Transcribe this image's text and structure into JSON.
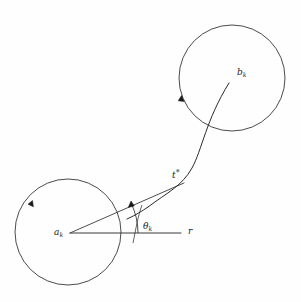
{
  "figure": {
    "domain_note": "geometric diagram with two circles, a curved trajectory, an angle and a reference ray",
    "background_color": "#fefefe",
    "stroke_color": "#262626",
    "labels": {
      "source_center": {
        "base": "a",
        "subscript": "k"
      },
      "target_center": {
        "base": "b",
        "subscript": "k"
      },
      "transition_point": {
        "base": "t",
        "superscript": "*"
      },
      "angle": {
        "base": "θ",
        "subscript": "k"
      },
      "reference_ray": {
        "base": "r"
      }
    },
    "geometry": {
      "left_circle": {
        "cx": 68,
        "cy": 232,
        "r": 53
      },
      "right_circle": {
        "cx": 232,
        "cy": 78,
        "r": 53
      },
      "angle_arc_radius": 68,
      "reference_ray_end_x": 181,
      "transition_point_xy": [
        183,
        183
      ]
    }
  }
}
